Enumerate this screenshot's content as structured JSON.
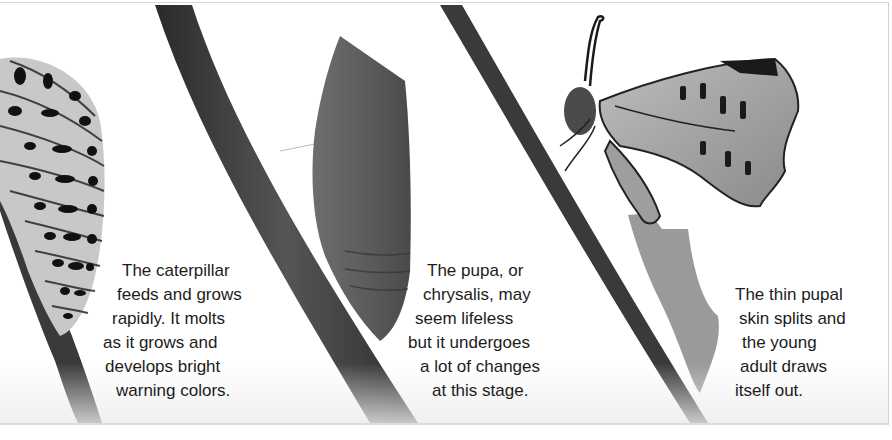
{
  "figure": {
    "stages": [
      {
        "name": "caterpillar",
        "caption_lines": [
          "The caterpillar",
          "feeds and grows",
          "rapidly. It molts",
          "as it grows and",
          "develops bright",
          "warning colors."
        ]
      },
      {
        "name": "pupa",
        "caption_lines": [
          "The pupa, or",
          "chrysalis, may",
          "seem lifeless",
          "but it undergoes",
          "a lot of changes",
          "at this stage."
        ]
      },
      {
        "name": "emerging-adult",
        "caption_lines": [
          "The thin pupal",
          "skin splits and",
          "the young",
          "adult draws",
          "itself out."
        ]
      }
    ]
  }
}
